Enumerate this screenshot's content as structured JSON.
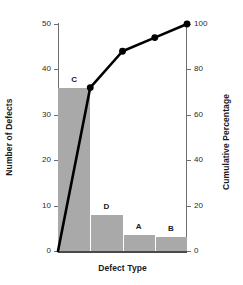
{
  "chart_data": {
    "type": "bar",
    "title": "",
    "xlabel": "Defect Type",
    "ylabel": "Number of Defects",
    "y2label": "Cumulative Percentage",
    "categories": [
      "C",
      "D",
      "A",
      "B"
    ],
    "values": [
      36,
      8,
      3.5,
      3
    ],
    "series": [
      {
        "name": "Number of Defects",
        "values": [
          36,
          8,
          3.5,
          3
        ],
        "axis": "left",
        "kind": "bar"
      },
      {
        "name": "Cumulative Percentage",
        "values": [
          72,
          88,
          94,
          100
        ],
        "axis": "right",
        "kind": "line"
      }
    ],
    "ylim": [
      0,
      50
    ],
    "y2lim": [
      0,
      100
    ],
    "yticks": [
      "0",
      "10",
      "20",
      "30",
      "40",
      "50"
    ],
    "y2ticks": [
      "0",
      "20",
      "40",
      "60",
      "80",
      "100"
    ],
    "grid": false,
    "legend": "none",
    "bar_color": "#a9a9a9",
    "line_color": "#000000",
    "marker_color": "#000000"
  },
  "axes": {
    "left": {
      "title": "Number of Defects",
      "ticks": [
        {
          "label": "50",
          "value": 50
        },
        {
          "label": "40",
          "value": 40
        },
        {
          "label": "30",
          "value": 30
        },
        {
          "label": "20",
          "value": 20
        },
        {
          "label": "10",
          "value": 10
        },
        {
          "label": "0",
          "value": 0
        }
      ]
    },
    "right": {
      "title": "Cumulative Percentage",
      "ticks": [
        {
          "label": "100",
          "value": 100
        },
        {
          "label": "80",
          "value": 80
        },
        {
          "label": "60",
          "value": 60
        },
        {
          "label": "40",
          "value": 40
        },
        {
          "label": "20",
          "value": 20
        },
        {
          "label": "0",
          "value": 0
        }
      ]
    },
    "bottom": {
      "title": "Defect Type"
    }
  },
  "bars": [
    {
      "label": "C",
      "value": 36
    },
    {
      "label": "D",
      "value": 8
    },
    {
      "label": "A",
      "value": 3.5
    },
    {
      "label": "B",
      "value": 3
    }
  ],
  "points": [
    {
      "label": "C",
      "cumulative": 72
    },
    {
      "label": "D",
      "cumulative": 88
    },
    {
      "label": "A",
      "cumulative": 94
    },
    {
      "label": "B",
      "cumulative": 100
    }
  ]
}
